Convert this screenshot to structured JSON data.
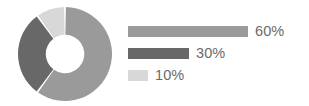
{
  "chart_data": {
    "type": "pie",
    "variant": "donut",
    "title": "",
    "subtitle": "",
    "xlabel": "",
    "ylabel": "",
    "grid": false,
    "legend_position": "right",
    "categories": [
      "60%",
      "30%",
      "10%"
    ],
    "values": [
      60,
      30,
      10
    ],
    "value_labels": [
      "60%",
      "30%",
      "10%"
    ],
    "colors": [
      "#9a9a9a",
      "#686868",
      "#d8d8d8"
    ],
    "slices": [
      {
        "label": "60%",
        "value": 60,
        "color": "#9a9a9a",
        "start_angle": 0,
        "end_angle": 216
      },
      {
        "label": "30%",
        "value": 30,
        "color": "#686868",
        "start_angle": 216,
        "end_angle": 324
      },
      {
        "label": "10%",
        "value": 10,
        "color": "#d8d8d8",
        "start_angle": 324,
        "end_angle": 360
      }
    ],
    "donut_hole_ratio": 0.41,
    "legend_bars": [
      {
        "label": "60%",
        "value": 60,
        "color": "#9a9a9a",
        "bar_width_px": 120
      },
      {
        "label": "30%",
        "value": 30,
        "color": "#686868",
        "bar_width_px": 61
      },
      {
        "label": "10%",
        "value": 10,
        "color": "#d8d8d8",
        "bar_width_px": 20
      }
    ]
  },
  "canvas": {
    "background": "#ffffff",
    "label_color": "#6a6a6a"
  }
}
